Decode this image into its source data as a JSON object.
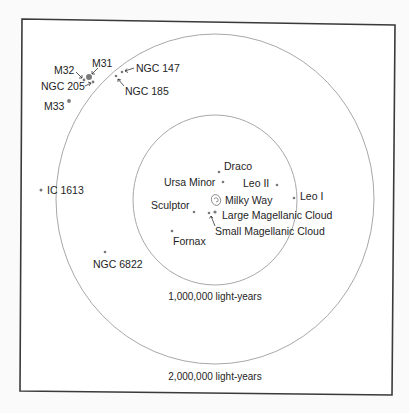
{
  "diagram": {
    "colors": {
      "frame": "#3a3a3a",
      "ring": "#a8a8a8",
      "dot": "#7a7a7a",
      "text": "#1e1e1e",
      "background": "#ffffff"
    },
    "rings": [
      {
        "label": "1,000,000 light-years",
        "cx": 215,
        "cy": 200,
        "rx": 82,
        "ry": 85
      },
      {
        "label": "2,000,000 light-years",
        "cx": 215,
        "cy": 199,
        "rx": 159,
        "ry": 165
      }
    ],
    "galaxies": [
      {
        "name": "Milky Way",
        "x": 216,
        "y": 200
      },
      {
        "name": "Draco",
        "x": 219,
        "y": 172
      },
      {
        "name": "Ursa Minor",
        "x": 223,
        "y": 182
      },
      {
        "name": "Leo II",
        "x": 277,
        "y": 185
      },
      {
        "name": "Leo I",
        "x": 294,
        "y": 198
      },
      {
        "name": "Sculptor",
        "x": 194,
        "y": 212
      },
      {
        "name": "Large Magellanic Cloud",
        "x": 215,
        "y": 212
      },
      {
        "name": "Small Magellanic Cloud",
        "x": 209,
        "y": 213
      },
      {
        "name": "Fornax",
        "x": 172,
        "y": 231
      },
      {
        "name": "NGC 6822",
        "x": 105,
        "y": 252
      },
      {
        "name": "IC 1613",
        "x": 41,
        "y": 190
      },
      {
        "name": "M31",
        "x": 89,
        "y": 77
      },
      {
        "name": "M32",
        "x": 84,
        "y": 80
      },
      {
        "name": "NGC 205",
        "x": 93,
        "y": 82
      },
      {
        "name": "M33",
        "x": 69,
        "y": 101
      },
      {
        "name": "NGC 147",
        "x": 122,
        "y": 72
      },
      {
        "name": "NGC 185",
        "x": 116,
        "y": 75
      }
    ],
    "labels": {
      "milky_way": "Milky Way",
      "draco": "Draco",
      "ursa_minor": "Ursa Minor",
      "leo_ii": "Leo II",
      "leo_i": "Leo I",
      "sculptor": "Sculptor",
      "lmc": "Large Magellanic Cloud",
      "smc": "Small Magellanic Cloud",
      "fornax": "Fornax",
      "ngc6822": "NGC 6822",
      "ic1613": "IC 1613",
      "m31": "M31",
      "m32": "M32",
      "ngc205": "NGC 205",
      "m33": "M33",
      "ngc147": "NGC 147",
      "ngc185": "NGC 185",
      "ring_inner": "1,000,000 light-years",
      "ring_outer": "2,000,000 light-years"
    }
  }
}
